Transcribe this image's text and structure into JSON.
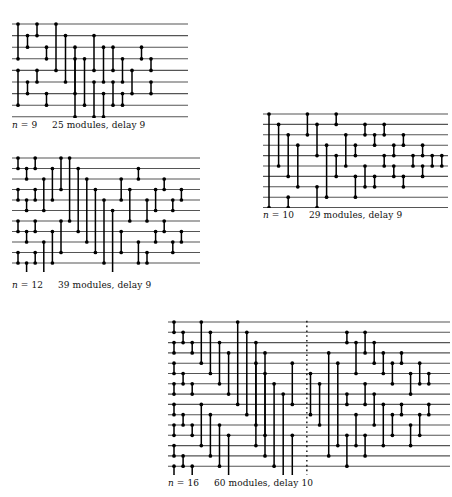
{
  "figure": {
    "background": "#ffffff",
    "line_color": "#555555",
    "module_color": "#000000",
    "divider_color": "#000000"
  },
  "networks": [
    {
      "id": "network-n9",
      "name": "sorting-network-n9",
      "n": 9,
      "modules": 25,
      "delay": 9,
      "caption": {
        "n_prefix": "n",
        "n_eq": "=",
        "n_value": "9",
        "summary": "25 modules, delay 9",
        "full": "n = 9     25 modules, delay 9"
      },
      "geometry": {
        "x": 12,
        "y": 22,
        "width": 176,
        "height": 96,
        "wires": 9,
        "wire_gap": 11.6,
        "col_gap": 9.5,
        "left_pad": 6
      },
      "comparators": [
        {
          "col": 0,
          "top": 0,
          "bottom": 3
        },
        {
          "col": 0,
          "top": 4,
          "bottom": 7
        },
        {
          "col": 1,
          "top": 1,
          "bottom": 2
        },
        {
          "col": 1,
          "top": 5,
          "bottom": 6
        },
        {
          "col": 2,
          "top": 0,
          "bottom": 1
        },
        {
          "col": 2,
          "top": 4,
          "bottom": 5
        },
        {
          "col": 3,
          "top": 2,
          "bottom": 3
        },
        {
          "col": 3,
          "top": 6,
          "bottom": 7
        },
        {
          "col": 4,
          "top": 0,
          "bottom": 4
        },
        {
          "col": 5,
          "top": 1,
          "bottom": 5
        },
        {
          "col": 6,
          "top": 2,
          "bottom": 6
        },
        {
          "col": 6,
          "top": 3,
          "bottom": 8
        },
        {
          "col": 7,
          "top": 3,
          "bottom": 7
        },
        {
          "col": 8,
          "top": 1,
          "bottom": 4
        },
        {
          "col": 8,
          "top": 5,
          "bottom": 8
        },
        {
          "col": 9,
          "top": 2,
          "bottom": 5
        },
        {
          "col": 9,
          "top": 6,
          "bottom": 8
        },
        {
          "col": 10,
          "top": 2,
          "bottom": 4
        },
        {
          "col": 10,
          "top": 5,
          "bottom": 7
        },
        {
          "col": 11,
          "top": 3,
          "bottom": 5
        },
        {
          "col": 11,
          "top": 6,
          "bottom": 7
        },
        {
          "col": 12,
          "top": 4,
          "bottom": 6
        },
        {
          "col": 13,
          "top": 2,
          "bottom": 3
        },
        {
          "col": 14,
          "top": 3,
          "bottom": 4
        },
        {
          "col": 14,
          "top": 5,
          "bottom": 6
        }
      ]
    },
    {
      "id": "network-n10",
      "name": "sorting-network-n10",
      "n": 10,
      "modules": 29,
      "delay": 9,
      "caption": {
        "n_prefix": "n",
        "n_eq": "=",
        "n_value": "10",
        "summary": "29 modules, delay 9",
        "full": "n = 10     29 modules, delay 9"
      },
      "geometry": {
        "x": 263,
        "y": 112,
        "width": 185,
        "height": 96,
        "wires": 10,
        "wire_gap": 10.4,
        "col_gap": 9.6,
        "left_pad": 6
      },
      "comparators": [
        {
          "col": 0,
          "top": 0,
          "bottom": 9
        },
        {
          "col": 1,
          "top": 1,
          "bottom": 5
        },
        {
          "col": 2,
          "top": 2,
          "bottom": 6
        },
        {
          "col": 2,
          "top": 8,
          "bottom": 9
        },
        {
          "col": 3,
          "top": 3,
          "bottom": 7
        },
        {
          "col": 4,
          "top": 0,
          "bottom": 2
        },
        {
          "col": 5,
          "top": 1,
          "bottom": 4
        },
        {
          "col": 5,
          "top": 7,
          "bottom": 9
        },
        {
          "col": 6,
          "top": 3,
          "bottom": 8
        },
        {
          "col": 7,
          "top": 0,
          "bottom": 1
        },
        {
          "col": 7,
          "top": 4,
          "bottom": 6
        },
        {
          "col": 8,
          "top": 2,
          "bottom": 5
        },
        {
          "col": 9,
          "top": 3,
          "bottom": 4
        },
        {
          "col": 9,
          "top": 6,
          "bottom": 8
        },
        {
          "col": 10,
          "top": 1,
          "bottom": 2
        },
        {
          "col": 10,
          "top": 5,
          "bottom": 7
        },
        {
          "col": 11,
          "top": 2,
          "bottom": 3
        },
        {
          "col": 11,
          "top": 6,
          "bottom": 7
        },
        {
          "col": 12,
          "top": 1,
          "bottom": 2
        },
        {
          "col": 12,
          "top": 4,
          "bottom": 5
        },
        {
          "col": 13,
          "top": 3,
          "bottom": 4
        },
        {
          "col": 13,
          "top": 5,
          "bottom": 6
        },
        {
          "col": 14,
          "top": 2,
          "bottom": 3
        },
        {
          "col": 14,
          "top": 6,
          "bottom": 7
        },
        {
          "col": 15,
          "top": 4,
          "bottom": 5
        },
        {
          "col": 16,
          "top": 3,
          "bottom": 4
        },
        {
          "col": 16,
          "top": 5,
          "bottom": 6
        },
        {
          "col": 17,
          "top": 4,
          "bottom": 5
        },
        {
          "col": 18,
          "top": 4,
          "bottom": 5
        }
      ]
    },
    {
      "id": "network-n12",
      "name": "sorting-network-n12",
      "n": 12,
      "modules": 39,
      "delay": 9,
      "caption": {
        "n_prefix": "n",
        "n_eq": "=",
        "n_value": "12",
        "summary": "39 modules, delay 9",
        "full": "n = 12     39 modules, delay 9"
      },
      "geometry": {
        "x": 12,
        "y": 156,
        "width": 188,
        "height": 116,
        "wires": 12,
        "wire_gap": 10.5,
        "col_gap": 8.6,
        "left_pad": 6
      },
      "comparators": [
        {
          "col": 0,
          "top": 0,
          "bottom": 1
        },
        {
          "col": 0,
          "top": 3,
          "bottom": 4
        },
        {
          "col": 0,
          "top": 6,
          "bottom": 7
        },
        {
          "col": 0,
          "top": 9,
          "bottom": 10
        },
        {
          "col": 1,
          "top": 1,
          "bottom": 2
        },
        {
          "col": 1,
          "top": 4,
          "bottom": 5
        },
        {
          "col": 1,
          "top": 7,
          "bottom": 8
        },
        {
          "col": 1,
          "top": 10,
          "bottom": 11
        },
        {
          "col": 2,
          "top": 0,
          "bottom": 1
        },
        {
          "col": 2,
          "top": 3,
          "bottom": 4
        },
        {
          "col": 2,
          "top": 6,
          "bottom": 7
        },
        {
          "col": 2,
          "top": 9,
          "bottom": 10
        },
        {
          "col": 3,
          "top": 2,
          "bottom": 5
        },
        {
          "col": 3,
          "top": 8,
          "bottom": 11
        },
        {
          "col": 4,
          "top": 1,
          "bottom": 4
        },
        {
          "col": 4,
          "top": 7,
          "bottom": 10
        },
        {
          "col": 5,
          "top": 0,
          "bottom": 3
        },
        {
          "col": 5,
          "top": 6,
          "bottom": 9
        },
        {
          "col": 6,
          "top": 0,
          "bottom": 6
        },
        {
          "col": 7,
          "top": 1,
          "bottom": 7
        },
        {
          "col": 8,
          "top": 2,
          "bottom": 8
        },
        {
          "col": 9,
          "top": 3,
          "bottom": 9
        },
        {
          "col": 10,
          "top": 4,
          "bottom": 10
        },
        {
          "col": 11,
          "top": 5,
          "bottom": 11
        },
        {
          "col": 12,
          "top": 2,
          "bottom": 4
        },
        {
          "col": 12,
          "top": 7,
          "bottom": 9
        },
        {
          "col": 13,
          "top": 3,
          "bottom": 6
        },
        {
          "col": 14,
          "top": 1,
          "bottom": 2
        },
        {
          "col": 14,
          "top": 8,
          "bottom": 10
        },
        {
          "col": 15,
          "top": 4,
          "bottom": 6
        },
        {
          "col": 15,
          "top": 9,
          "bottom": 10
        },
        {
          "col": 16,
          "top": 3,
          "bottom": 5
        },
        {
          "col": 16,
          "top": 7,
          "bottom": 8
        },
        {
          "col": 17,
          "top": 2,
          "bottom": 3
        },
        {
          "col": 17,
          "top": 6,
          "bottom": 7
        },
        {
          "col": 18,
          "top": 4,
          "bottom": 5
        },
        {
          "col": 18,
          "top": 8,
          "bottom": 9
        },
        {
          "col": 19,
          "top": 3,
          "bottom": 4
        },
        {
          "col": 19,
          "top": 7,
          "bottom": 8
        }
      ]
    },
    {
      "id": "network-n16",
      "name": "sorting-network-n16",
      "n": 16,
      "modules": 60,
      "delay": 10,
      "caption": {
        "n_prefix": "n",
        "n_eq": "=",
        "n_value": "16",
        "summary": "60 modules, delay 10",
        "full": "n = 16     60 modules, delay 10"
      },
      "geometry": {
        "x": 168,
        "y": 320,
        "width": 282,
        "height": 155,
        "wires": 16,
        "wire_gap": 10.3,
        "col_gap": 9.1,
        "left_pad": 6
      },
      "divider": {
        "col": 14.6,
        "style": "dotted",
        "label": "phase-divider"
      },
      "comparators": [
        {
          "col": 0,
          "top": 0,
          "bottom": 1
        },
        {
          "col": 0,
          "top": 2,
          "bottom": 3
        },
        {
          "col": 0,
          "top": 4,
          "bottom": 5
        },
        {
          "col": 0,
          "top": 6,
          "bottom": 7
        },
        {
          "col": 0,
          "top": 8,
          "bottom": 9
        },
        {
          "col": 0,
          "top": 10,
          "bottom": 11
        },
        {
          "col": 0,
          "top": 12,
          "bottom": 13
        },
        {
          "col": 0,
          "top": 14,
          "bottom": 15
        },
        {
          "col": 1,
          "top": 1,
          "bottom": 2
        },
        {
          "col": 1,
          "top": 5,
          "bottom": 6
        },
        {
          "col": 1,
          "top": 9,
          "bottom": 10
        },
        {
          "col": 1,
          "top": 13,
          "bottom": 14
        },
        {
          "col": 2,
          "top": 2,
          "bottom": 3
        },
        {
          "col": 2,
          "top": 6,
          "bottom": 7
        },
        {
          "col": 2,
          "top": 10,
          "bottom": 11
        },
        {
          "col": 2,
          "top": 14,
          "bottom": 15
        },
        {
          "col": 3,
          "top": 0,
          "bottom": 4
        },
        {
          "col": 3,
          "top": 8,
          "bottom": 12
        },
        {
          "col": 4,
          "top": 1,
          "bottom": 5
        },
        {
          "col": 4,
          "top": 9,
          "bottom": 13
        },
        {
          "col": 5,
          "top": 2,
          "bottom": 6
        },
        {
          "col": 5,
          "top": 10,
          "bottom": 14
        },
        {
          "col": 6,
          "top": 3,
          "bottom": 7
        },
        {
          "col": 6,
          "top": 11,
          "bottom": 15
        },
        {
          "col": 7,
          "top": 0,
          "bottom": 8
        },
        {
          "col": 8,
          "top": 1,
          "bottom": 9
        },
        {
          "col": 9,
          "top": 2,
          "bottom": 10
        },
        {
          "col": 9,
          "top": 4,
          "bottom": 12
        },
        {
          "col": 10,
          "top": 3,
          "bottom": 11
        },
        {
          "col": 10,
          "top": 5,
          "bottom": 13
        },
        {
          "col": 11,
          "top": 6,
          "bottom": 14
        },
        {
          "col": 12,
          "top": 7,
          "bottom": 15
        },
        {
          "col": 13,
          "top": 4,
          "bottom": 8
        },
        {
          "col": 13,
          "top": 11,
          "bottom": 15
        },
        {
          "col": 15,
          "top": 5,
          "bottom": 9
        },
        {
          "col": 16,
          "top": 6,
          "bottom": 10
        },
        {
          "col": 17,
          "top": 3,
          "bottom": 13
        },
        {
          "col": 18,
          "top": 4,
          "bottom": 12
        },
        {
          "col": 19,
          "top": 1,
          "bottom": 2
        },
        {
          "col": 19,
          "top": 7,
          "bottom": 8
        },
        {
          "col": 19,
          "top": 11,
          "bottom": 14
        },
        {
          "col": 20,
          "top": 2,
          "bottom": 5
        },
        {
          "col": 20,
          "top": 9,
          "bottom": 12
        },
        {
          "col": 21,
          "top": 1,
          "bottom": 3
        },
        {
          "col": 21,
          "top": 6,
          "bottom": 8
        },
        {
          "col": 21,
          "top": 11,
          "bottom": 13
        },
        {
          "col": 22,
          "top": 2,
          "bottom": 4
        },
        {
          "col": 22,
          "top": 7,
          "bottom": 10
        },
        {
          "col": 23,
          "top": 3,
          "bottom": 5
        },
        {
          "col": 23,
          "top": 8,
          "bottom": 12
        },
        {
          "col": 24,
          "top": 4,
          "bottom": 6
        },
        {
          "col": 24,
          "top": 9,
          "bottom": 11
        },
        {
          "col": 25,
          "top": 3,
          "bottom": 4
        },
        {
          "col": 25,
          "top": 8,
          "bottom": 9
        },
        {
          "col": 26,
          "top": 5,
          "bottom": 7
        },
        {
          "col": 26,
          "top": 10,
          "bottom": 12
        },
        {
          "col": 27,
          "top": 4,
          "bottom": 6
        },
        {
          "col": 27,
          "top": 9,
          "bottom": 11
        },
        {
          "col": 28,
          "top": 5,
          "bottom": 6
        },
        {
          "col": 28,
          "top": 8,
          "bottom": 9
        }
      ]
    }
  ],
  "captions": [
    {
      "id": "caption-n9",
      "x": 12,
      "y": 120,
      "for": "network-n9"
    },
    {
      "id": "caption-n10",
      "x": 263,
      "y": 210,
      "for": "network-n10"
    },
    {
      "id": "caption-n12",
      "x": 12,
      "y": 280,
      "for": "network-n12"
    },
    {
      "id": "caption-n16",
      "x": 168,
      "y": 478,
      "for": "network-n16"
    }
  ]
}
